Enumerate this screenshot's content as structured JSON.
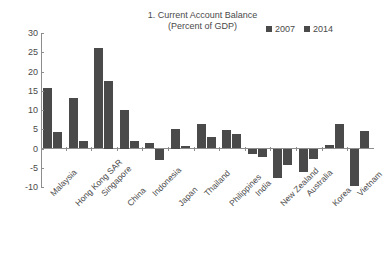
{
  "title": {
    "line1": "1. Current Account Balance",
    "line2": "(Percent of GDP)"
  },
  "legend": {
    "position": "top-right",
    "entries": [
      {
        "label": "2007",
        "color": "#4a4a4a"
      },
      {
        "label": "2014",
        "color": "#4a4a4a"
      }
    ]
  },
  "axis": {
    "yticks": [
      "30",
      "25",
      "20",
      "15",
      "10",
      "5",
      "0",
      "-5",
      "-10"
    ]
  },
  "chart_data": {
    "type": "bar",
    "title": "1. Current Account Balance (Percent of GDP)",
    "xlabel": "",
    "ylabel": "",
    "ylim": [
      -10,
      30
    ],
    "ytick_values": [
      30,
      25,
      20,
      15,
      10,
      5,
      0,
      -5,
      -10
    ],
    "grid": false,
    "legend_position": "top-right",
    "categories": [
      "Malaysia",
      "Hong Kong SAR",
      "Singapore",
      "China",
      "Indonesia",
      "Japan",
      "Thailand",
      "Philippines",
      "India",
      "New Zealand",
      "Australia",
      "Korea",
      "Vietnam"
    ],
    "series": [
      {
        "name": "2007",
        "color": "#4a4a4a",
        "values": [
          15.8,
          13.0,
          26.0,
          10.0,
          1.5,
          5.0,
          6.3,
          4.9,
          -1.3,
          -7.7,
          -6.2,
          1.0,
          -9.8
        ]
      },
      {
        "name": "2014",
        "color": "#4a4a4a",
        "values": [
          4.2,
          2.0,
          17.5,
          2.0,
          -3.0,
          0.7,
          3.0,
          3.8,
          -2.2,
          -4.2,
          -2.8,
          6.3,
          4.5
        ]
      }
    ]
  }
}
